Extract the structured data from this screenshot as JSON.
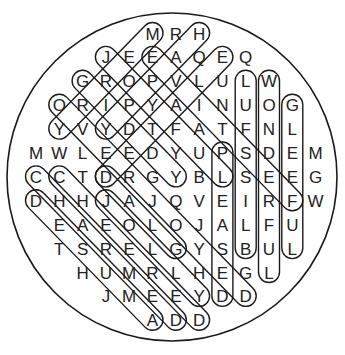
{
  "puzzle": {
    "type": "word-search",
    "shape": "circle",
    "colors": {
      "letters": "#222222",
      "lines": "#1a1a1a",
      "background": "#ffffff"
    },
    "rows": [
      {
        "start_col": 5,
        "letters": "MRH"
      },
      {
        "start_col": 3,
        "letters": "JEEAQEQ"
      },
      {
        "start_col": 2,
        "letters": "GROPVLULW"
      },
      {
        "start_col": 1,
        "letters": "ORIPYAINUOG"
      },
      {
        "start_col": 1,
        "letters": "YVYDTFATFNL"
      },
      {
        "start_col": 0,
        "letters": "MWLEEDYUPSDEM"
      },
      {
        "start_col": 0,
        "letters": "CCTDRGYBLSEEG"
      },
      {
        "start_col": 0,
        "letters": "DHHJAJQVEIRFW"
      },
      {
        "start_col": 1,
        "letters": "EAEOLOJALFU"
      },
      {
        "start_col": 1,
        "letters": "TSRELGYSBUL"
      },
      {
        "start_col": 2,
        "letters": "HUMRLHEGL"
      },
      {
        "start_col": 3,
        "letters": "JMEEYDD"
      },
      {
        "start_col": 5,
        "letters": "ADD"
      }
    ],
    "found_words": [
      {
        "word": "MERRY",
        "start": [
          0,
          5
        ],
        "end": [
          4,
          1
        ]
      },
      {
        "word": "HAPPY",
        "start": [
          0,
          7
        ],
        "end": [
          4,
          3
        ]
      },
      {
        "word": "JOYFUL",
        "start": [
          1,
          3
        ],
        "end": [
          6,
          8
        ]
      },
      {
        "word": "ELATED",
        "start": [
          1,
          8
        ],
        "end": [
          6,
          3
        ]
      },
      {
        "word": "FESTIVE",
        "start": [
          7,
          11
        ],
        "end": [
          1,
          5
        ]
      },
      {
        "word": "GIDDY",
        "start": [
          2,
          2
        ],
        "end": [
          6,
          6
        ]
      },
      {
        "word": "OVERJOYED",
        "start": [
          3,
          1
        ],
        "end": [
          11,
          9
        ]
      },
      {
        "word": "CHARMED",
        "start": [
          6,
          0
        ],
        "end": [
          12,
          6
        ]
      },
      {
        "word": "CHEERED",
        "start": [
          6,
          1
        ],
        "end": [
          12,
          7
        ]
      },
      {
        "word": "AMUSED",
        "start": [
          12,
          5
        ],
        "end": [
          7,
          0
        ]
      },
      {
        "word": "JOLLY",
        "start": [
          7,
          3
        ],
        "end": [
          11,
          7
        ]
      },
      {
        "word": "GLAD",
        "start": [
          9,
          6
        ],
        "end": [
          6,
          3
        ]
      },
      {
        "word": "PLEASED",
        "start": [
          5,
          8
        ],
        "end": [
          11,
          8
        ]
      },
      {
        "word": "BLISSFUL",
        "start": [
          9,
          9
        ],
        "end": [
          2,
          9
        ]
      },
      {
        "word": "WONDERFUL",
        "start": [
          2,
          10
        ],
        "end": [
          10,
          10
        ]
      },
      {
        "word": "GLEEFUL",
        "start": [
          3,
          11
        ],
        "end": [
          9,
          11
        ]
      }
    ]
  }
}
